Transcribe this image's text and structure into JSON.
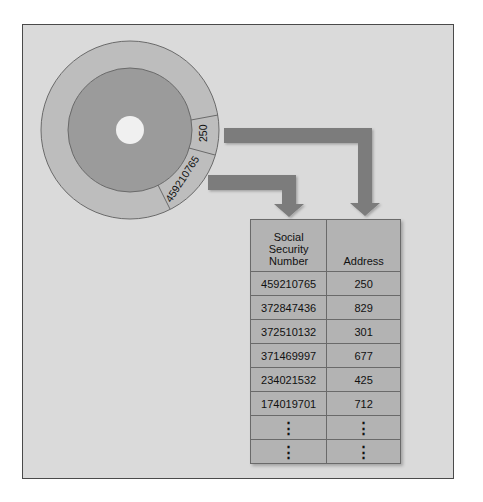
{
  "disk": {
    "sector_labels": {
      "address": "250",
      "ssn": "459210765"
    }
  },
  "table": {
    "headers": [
      "Social\nSecurity\nNumber",
      "Address"
    ],
    "header_lines": {
      "ssn": [
        "Social",
        "Security",
        "Number"
      ],
      "address": "Address"
    },
    "rows": [
      {
        "ssn": "459210765",
        "address": "250"
      },
      {
        "ssn": "372847436",
        "address": "829"
      },
      {
        "ssn": "372510132",
        "address": "301"
      },
      {
        "ssn": "371469997",
        "address": "677"
      },
      {
        "ssn": "234021532",
        "address": "425"
      },
      {
        "ssn": "174019701",
        "address": "712"
      },
      {
        "ssn": "⋮",
        "address": "⋮"
      },
      {
        "ssn": "⋮",
        "address": "⋮"
      }
    ]
  },
  "colors": {
    "panel": "#dadada",
    "outer_ring": "#bdbdbd",
    "inner_disk": "#9b9b9b",
    "hole": "#f0f0f0",
    "arrow": "#7b7b7b",
    "table_cell": "#b3b3b3"
  }
}
